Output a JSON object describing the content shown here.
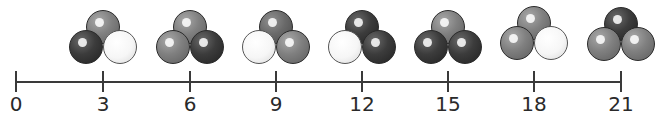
{
  "number_line": {
    "min": 0,
    "max": 21,
    "step": 3,
    "ticks": [
      {
        "value": 0,
        "label": "0"
      },
      {
        "value": 3,
        "label": "3"
      },
      {
        "value": 6,
        "label": "6"
      },
      {
        "value": 9,
        "label": "9"
      },
      {
        "value": 12,
        "label": "12"
      },
      {
        "value": 15,
        "label": "15"
      },
      {
        "value": 18,
        "label": "18"
      },
      {
        "value": 21,
        "label": "21"
      }
    ]
  },
  "ball_groups": [
    {
      "at": 3,
      "balls": {
        "top": "gray",
        "left": "black",
        "right": "white"
      }
    },
    {
      "at": 6,
      "balls": {
        "top": "gray",
        "left": "gray",
        "right": "black"
      }
    },
    {
      "at": 9,
      "balls": {
        "top": "dgray",
        "left": "white",
        "right": "gray"
      }
    },
    {
      "at": 12,
      "balls": {
        "top": "black",
        "left": "white",
        "right": "black"
      }
    },
    {
      "at": 15,
      "balls": {
        "top": "gray",
        "left": "black",
        "right": "black"
      }
    },
    {
      "at": 18,
      "balls": {
        "top": "gray",
        "left": "gray",
        "right": "white"
      }
    },
    {
      "at": 21,
      "balls": {
        "top": "black",
        "left": "gray",
        "right": "gray"
      }
    }
  ],
  "colors": {
    "line": "#3a3a3a",
    "label": "#2a2a2a",
    "black_ball": "#333333",
    "gray_ball": "#808080",
    "white_ball": "#f6f6f6"
  }
}
